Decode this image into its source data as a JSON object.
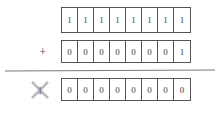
{
  "operand_a": {
    "bits": [
      "1",
      "1",
      "1",
      "1",
      "1",
      "1",
      "1",
      "1"
    ]
  },
  "operator": "+",
  "operand_b": {
    "bits": [
      "0",
      "0",
      "0",
      "0",
      "0",
      "0",
      "0",
      "1"
    ]
  },
  "carry_out": {
    "icon": "cross-icon",
    "value": "1"
  },
  "result": {
    "bits": [
      "0",
      "0",
      "0",
      "0",
      "0",
      "0",
      "0",
      "0"
    ]
  },
  "colors": {
    "border": "#555555",
    "text": "#444444",
    "cross": "#bbbbbb"
  }
}
